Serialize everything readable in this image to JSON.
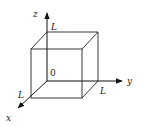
{
  "diagram": {
    "type": "3d-cube-with-axes",
    "axes": {
      "x_label": "x",
      "y_label": "y",
      "z_label": "z"
    },
    "origin_label": "0",
    "edge_labels": {
      "z_edge": "L",
      "y_edge": "L",
      "x_edge": "L"
    },
    "colors": {
      "line": "#222222",
      "background": "#ffffff"
    }
  }
}
